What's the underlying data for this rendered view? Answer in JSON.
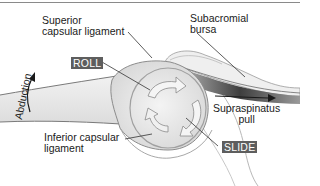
{
  "diagram": {
    "labels": {
      "superior_capsular_ligament_line1": "Superior",
      "superior_capsular_ligament_line2": "capsular ligament",
      "subacromial_bursa_line1": "Subacromial",
      "subacromial_bursa_line2": "bursa",
      "abduction": "Abduction",
      "roll": "ROLL",
      "slide": "SLIDE",
      "supraspinatus_line1": "Supraspinatus",
      "supraspinatus_line2": "pull",
      "inferior_capsular_ligament_line1": "Inferior capsular",
      "inferior_capsular_ligament_line2": "ligament"
    },
    "icons": [
      "abduction-arrow-icon",
      "roll-arrow-icon",
      "slide-arrow-icon",
      "supraspinatus-pull-arrow-icon"
    ],
    "colors": {
      "tag_background": "#5e5e5e",
      "tag_text": "#ffffff",
      "bone_fill": "#e9e9e9",
      "muscle_dark": "#3a3a3a",
      "outline": "#8c8c8c",
      "leader_line": "#333333"
    }
  }
}
